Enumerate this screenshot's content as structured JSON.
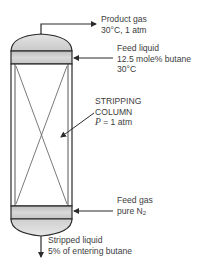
{
  "diagram": {
    "type": "stripping-column-flow-diagram",
    "column": {
      "label_line1": "STRIPPING",
      "label_line2": "COLUMN",
      "pressure_symbol": "P",
      "pressure_value": " = 1 atm"
    },
    "streams": {
      "product_gas": {
        "title": "Product gas",
        "detail": "30°C, 1 atm"
      },
      "feed_liquid": {
        "title": "Feed liquid",
        "detail1": "12.5 mole% butane",
        "detail2": "30°C"
      },
      "feed_gas": {
        "title": "Feed gas",
        "detail_prefix": "pure N",
        "detail_sub": "2"
      },
      "stripped_liquid": {
        "title": "Stripped liquid",
        "detail": "5% of entering butane"
      }
    },
    "colors": {
      "outline": "#2b2b2b",
      "band_fill": "#c8c8c8",
      "dome_fill": "#d6d6d6",
      "packing_lines": "#6a6a6a",
      "text": "#3d3d3d"
    }
  }
}
